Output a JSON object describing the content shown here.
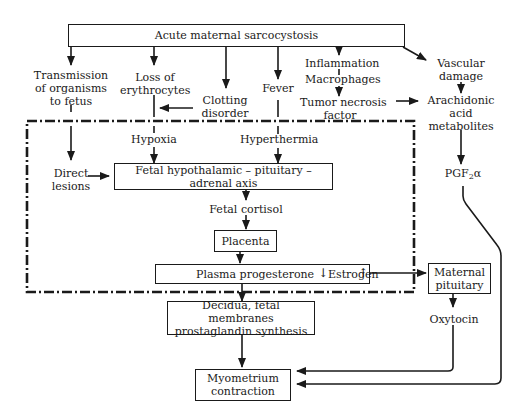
{
  "diagram": {
    "title_box": "Acute maternal sarcocystosis",
    "nodes": {
      "transmission": [
        "Transmission",
        "of organisms",
        "to fetus"
      ],
      "loss_erythrocytes": [
        "Loss of",
        "erythrocytes"
      ],
      "clotting": [
        "Clotting",
        "disorder"
      ],
      "fever": "Fever",
      "inflammation": "Inflammation",
      "macrophages": "Macrophages",
      "tnf": [
        "Tumor necrosis",
        "factor"
      ],
      "vascular": [
        "Vascular",
        "damage"
      ],
      "arachidonic": [
        "Arachidonic",
        "acid",
        "metabolites"
      ],
      "hypoxia": "Hypoxia",
      "hyperthermia": "Hyperthermia",
      "direct_lesions": [
        "Direct",
        "lesions"
      ],
      "fhpa_axis": "Fetal hypothalamic – pituitary – adrenal axis",
      "fetal_cortisol": "Fetal cortisol",
      "placenta": "Placenta",
      "plasma_progesterone": "Plasma progesterone",
      "estrogen": "Estrogen",
      "pgf_main": "PGF",
      "pgf_sub": "2",
      "pgf_suffix": "α",
      "maternal_pituitary": [
        "Maternal",
        "pituitary"
      ],
      "oxytocin": "Oxytocin",
      "decidua": [
        "Decidua, fetal membranes",
        "prostaglandin synthesis"
      ],
      "myometrium": [
        "Myometrium",
        "contraction"
      ]
    },
    "indicators": {
      "progesterone_direction": "down-arrow",
      "estrogen_direction": "up-arrow"
    },
    "region": "fetal-compartment dash-dot boundary"
  }
}
